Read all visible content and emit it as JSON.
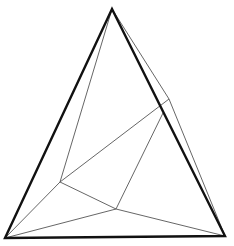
{
  "diagram": {
    "type": "geometric-line-drawing",
    "colors": {
      "background": "#ffffff",
      "outer_stroke": "#111111",
      "inner_stroke": "#555555"
    },
    "vertices": {
      "A_top": [
        112,
        9
      ],
      "B_bottom_left": [
        5,
        238
      ],
      "C_bottom_right": [
        225,
        236
      ],
      "D_right_outer": [
        169,
        99
      ],
      "E_right_inner": [
        163,
        113
      ],
      "F_left_inner": [
        60,
        182
      ],
      "G_mid_bottom": [
        116,
        209
      ]
    },
    "outer_triangle": [
      "A_top",
      "B_bottom_left",
      "C_bottom_right"
    ],
    "inner_edges": [
      [
        "A_top",
        "F_left_inner"
      ],
      [
        "A_top",
        "D_right_outer"
      ],
      [
        "D_right_outer",
        "C_bottom_right"
      ],
      [
        "D_right_outer",
        "F_left_inner"
      ],
      [
        "E_right_inner",
        "G_mid_bottom"
      ],
      [
        "F_left_inner",
        "B_bottom_left"
      ],
      [
        "F_left_inner",
        "G_mid_bottom"
      ],
      [
        "G_mid_bottom",
        "B_bottom_left"
      ],
      [
        "G_mid_bottom",
        "C_bottom_right"
      ]
    ]
  }
}
